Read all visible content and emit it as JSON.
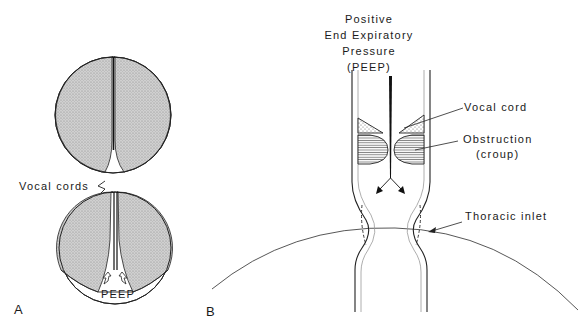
{
  "figure": {
    "panel_a": {
      "panel_label": "A",
      "vocal_cords_label": "Vocal cords",
      "peep_label": "PEEP"
    },
    "panel_b": {
      "panel_label": "B",
      "peep_title_lines": [
        "Positive",
        "End Expiratory",
        "Pressure",
        "(PEEP)"
      ],
      "vocal_cord_label": "Vocal cord",
      "obstruction_label_lines": [
        "Obstruction",
        "(croup)"
      ],
      "thoracic_inlet_label": "Thoracic inlet"
    },
    "colors": {
      "line": "#1a1a1a",
      "stipple_fill": "#c8c8c8",
      "background": "#ffffff"
    }
  }
}
